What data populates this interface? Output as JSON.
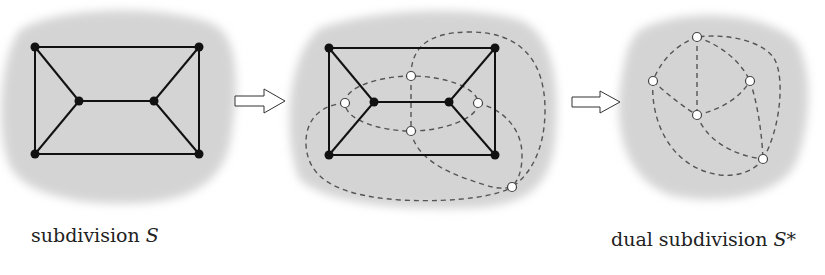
{
  "colors": {
    "blob": "#d3d3d3",
    "edge": "#111111",
    "dual_edge": "#555555",
    "vertex_fill": "#111111",
    "dual_vertex_fill": "#ffffff",
    "dual_vertex_stroke": "#444444"
  },
  "panels": [
    {
      "id": "primal",
      "vertices": [
        [
          35,
          47
        ],
        [
          199,
          47
        ],
        [
          35,
          154
        ],
        [
          199,
          154
        ],
        [
          79,
          101
        ],
        [
          154,
          101
        ]
      ],
      "edges": [
        [
          0,
          1
        ],
        [
          2,
          3
        ],
        [
          0,
          2
        ],
        [
          1,
          3
        ],
        [
          0,
          4
        ],
        [
          2,
          4
        ],
        [
          4,
          5
        ],
        [
          1,
          5
        ],
        [
          3,
          5
        ]
      ]
    },
    {
      "id": "overlay",
      "vertices": [
        [
          329,
          48
        ],
        [
          495,
          48
        ],
        [
          329,
          155
        ],
        [
          495,
          155
        ],
        [
          374,
          102
        ],
        [
          449,
          102
        ]
      ],
      "edges": [
        [
          0,
          1
        ],
        [
          2,
          3
        ],
        [
          0,
          2
        ],
        [
          1,
          3
        ],
        [
          0,
          4
        ],
        [
          2,
          4
        ],
        [
          4,
          5
        ],
        [
          1,
          5
        ],
        [
          3,
          5
        ]
      ],
      "dual_vertices": [
        [
          345,
          103
        ],
        [
          411,
          76
        ],
        [
          478,
          103
        ],
        [
          411,
          131
        ],
        [
          512,
          187
        ]
      ]
    },
    {
      "id": "dual",
      "dual_vertices": [
        [
          697,
          37
        ],
        [
          653,
          81
        ],
        [
          750,
          81
        ],
        [
          697,
          115
        ],
        [
          763,
          159
        ]
      ]
    }
  ],
  "arrows": [
    {
      "name": "arrow-primal-to-overlay",
      "x": 235,
      "y": 101
    },
    {
      "name": "arrow-overlay-to-dual",
      "x": 572,
      "y": 102
    }
  ],
  "captions": {
    "left_text": "subdivision ",
    "left_math": "S",
    "right_text": "dual subdivision ",
    "right_math": "S*"
  }
}
